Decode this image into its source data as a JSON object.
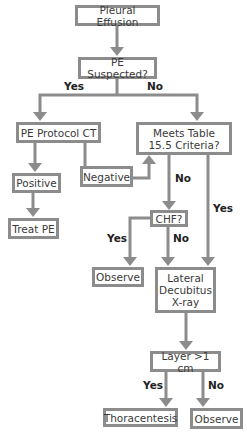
{
  "nodes": {
    "pleural_effusion": "Pleural Effusion",
    "pe_suspected": "PE Suspected?",
    "pe_protocol_ct": "PE Protocol CT",
    "meets_criteria": "Meets Table 15.5 Criteria?",
    "positive": "Positive",
    "negative": "Negative",
    "treat_pe": "Treat PE",
    "chf": "CHF?",
    "observe_chf": "Observe",
    "lateral_decubitus": "Lateral Decubitus X-ray",
    "layer": "Layer >1 cm",
    "thoracentesis": "Thoracentesis",
    "observe_layer": "Observe"
  },
  "labels": {
    "pe_yes": "Yes",
    "pe_no": "No",
    "criteria_no": "No",
    "criteria_yes": "Yes",
    "chf_yes": "Yes",
    "chf_no": "No",
    "layer_yes": "Yes",
    "layer_no": "No"
  },
  "colors": {
    "line": "#8c8c8c"
  }
}
